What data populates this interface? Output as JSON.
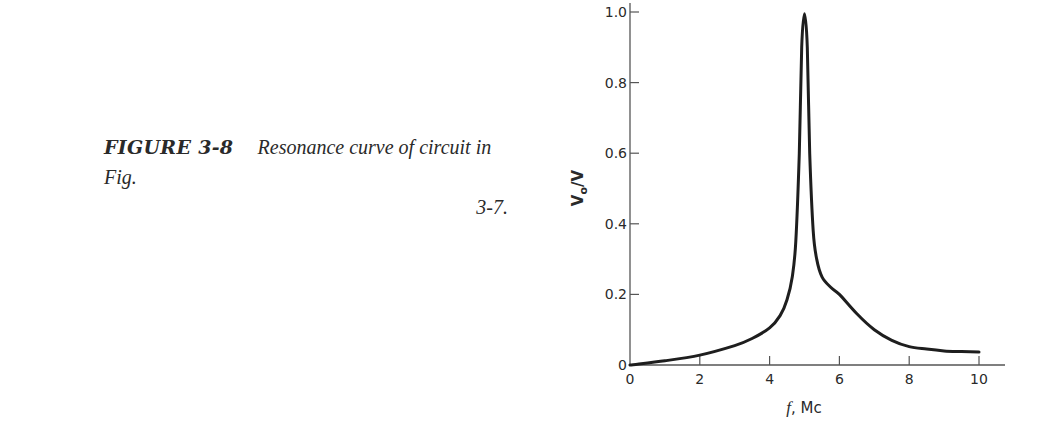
{
  "caption": {
    "figure_label": "FIGURE 3-8",
    "text_line1": "Resonance curve of circuit in Fig.",
    "text_line2": "3-7."
  },
  "chart_data": {
    "type": "line",
    "title": "Resonance curve of circuit in Fig. 3-7.",
    "xlabel": "f, Mc",
    "ylabel": "Vo/V",
    "xlim": [
      0,
      10
    ],
    "ylim": [
      0,
      1.0
    ],
    "grid": false,
    "legend": null,
    "xticks": [
      0,
      2,
      4,
      6,
      8,
      10
    ],
    "xtick_labels": [
      "0",
      "2",
      "4",
      "6",
      "8",
      "10"
    ],
    "yticks": [
      0,
      0.2,
      0.4,
      0.6,
      0.8,
      1.0
    ],
    "ytick_labels": [
      "0",
      "0.2",
      "0.4",
      "0.6",
      "0.8",
      "1.0"
    ],
    "series": [
      {
        "name": "Vo/V",
        "x": [
          0,
          1,
          2,
          3,
          3.5,
          4,
          4.3,
          4.5,
          4.65,
          4.75,
          4.85,
          4.92,
          5.0,
          5.08,
          5.15,
          5.25,
          5.35,
          5.5,
          5.75,
          6,
          6.5,
          7,
          7.5,
          8,
          8.5,
          9,
          9.5,
          10
        ],
        "y": [
          0.0,
          0.012,
          0.028,
          0.055,
          0.075,
          0.105,
          0.14,
          0.185,
          0.25,
          0.35,
          0.6,
          0.9,
          0.995,
          0.9,
          0.6,
          0.38,
          0.3,
          0.25,
          0.22,
          0.2,
          0.145,
          0.1,
          0.07,
          0.052,
          0.045,
          0.04,
          0.038,
          0.037
        ]
      }
    ],
    "peak": {
      "x": 5.0,
      "y": 1.0
    }
  },
  "axes": {
    "x_title_f": "f",
    "x_title_unit": ", Mc",
    "y_title_main": "V",
    "y_title_sub": "o",
    "y_title_rest": "/V"
  }
}
